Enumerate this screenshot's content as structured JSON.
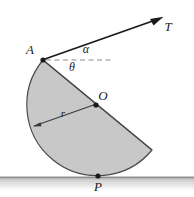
{
  "figure": {
    "type": "physics-mechanics-diagram",
    "background_color": "#ffffff",
    "body": {
      "name": "half-disc",
      "fill_color": "#c8c8c8",
      "stroke_color": "#3c3c3c",
      "center": {
        "x": 96,
        "y": 105
      },
      "radius": 70
    },
    "ground": {
      "color": "#b4b4b4",
      "shadow_color": "#d8d8d8",
      "y": 177
    },
    "points": [
      {
        "id": "A",
        "label": "A",
        "x": 43,
        "y": 60,
        "label_x": 30,
        "label_y": 54,
        "description": "rope attachment point on rim"
      },
      {
        "id": "O",
        "label": "O",
        "x": 96,
        "y": 105,
        "label_x": 101,
        "label_y": 100,
        "description": "center of the disc"
      },
      {
        "id": "P",
        "label": "P",
        "x": 98,
        "y": 176,
        "label_x": 98,
        "label_y": 190,
        "description": "contact point with ground"
      }
    ],
    "angles": [
      {
        "id": "alpha",
        "label": "α",
        "x": 86,
        "y": 51,
        "description": "angle between rope T and horizontal dashed reference"
      },
      {
        "id": "theta",
        "label": "θ",
        "x": 72,
        "y": 69,
        "description": "angle between the diameter AO and horizontal dashed reference"
      }
    ],
    "vectors": [
      {
        "id": "T",
        "label": "T",
        "label_x": 167,
        "label_y": 30,
        "start": {
          "x": 43,
          "y": 60
        },
        "end": {
          "x": 163,
          "y": 17
        },
        "color": "#1a1a1a",
        "description": "tension force along the rope"
      }
    ],
    "dimensions": [
      {
        "id": "r",
        "label": "r",
        "label_x": 63,
        "label_y": 116,
        "start": {
          "x": 96,
          "y": 105
        },
        "end": {
          "x": 33,
          "y": 127
        },
        "description": "radius of the half-disc"
      }
    ],
    "reference_lines": [
      {
        "id": "horizontal-dashed",
        "style": "dashed",
        "color": "#8c8c8c",
        "start": {
          "x": 46,
          "y": 60
        },
        "end": {
          "x": 112,
          "y": 60
        },
        "description": "horizontal reference line through A"
      }
    ]
  }
}
